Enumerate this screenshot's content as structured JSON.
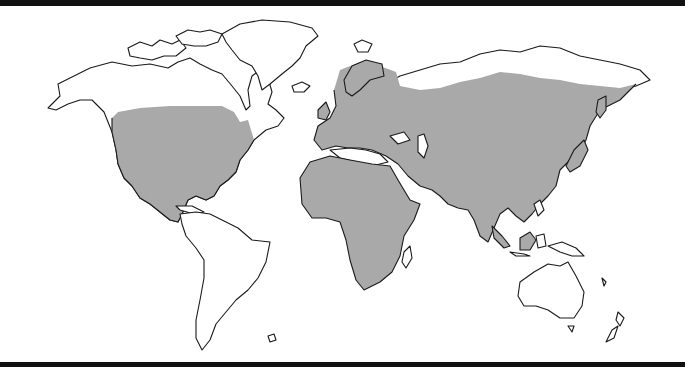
{
  "map": {
    "type": "world-distribution-map",
    "projection": "equirectangular-like",
    "colors": {
      "background": "#ffffff",
      "land": "#ffffff",
      "coastline": "#1a1a1a",
      "range_fill": "#a9a9a9",
      "frame_bars": "#111111"
    },
    "shaded_regions": [
      "North America (southern Canada, United States, Mexico)",
      "Europe",
      "Africa",
      "Asia (excluding far north Siberia)",
      "Borneo / Indonesia (part)"
    ],
    "unshaded_regions": [
      "Arctic Canada & Alaska",
      "Greenland",
      "South America",
      "Australia",
      "New Zealand",
      "Northern Siberia"
    ]
  }
}
